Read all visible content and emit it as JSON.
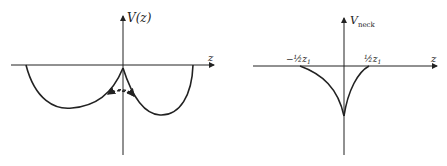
{
  "diagrams": [
    {
      "id": "left",
      "y_axis_label": "V(z)",
      "x_axis_label": "z",
      "description": "Double-well potential V(z) with two minima; dashed arrow indicates tunneling between wells near z=0"
    },
    {
      "id": "right",
      "y_axis_label": "V",
      "y_axis_label_subscript": "neck",
      "x_axis_label": "z",
      "left_mark": "−½z",
      "left_mark_subscript": "1",
      "right_mark": "½z",
      "right_mark_subscript": "1",
      "description": "Neck potential with cusp minimum at z=0, zero outside ±½z₁"
    }
  ],
  "colors": {
    "ink": "#222222",
    "background": "#ffffff"
  }
}
